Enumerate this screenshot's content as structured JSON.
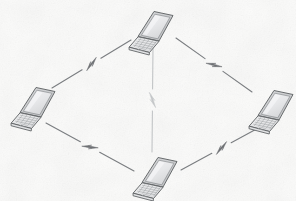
{
  "diagram": {
    "title": "Wireless mesh network of four laptops",
    "type": "network-topology",
    "canvas": {
      "width": 296,
      "height": 201
    },
    "background": {
      "color": "#fbfbfa",
      "texture": "speckled-paper",
      "texture_color": "#e8e8e6"
    },
    "style": {
      "line_color": "#7a7d80",
      "line_color_faint": "#bdc0c2",
      "laptop_outline": "#5a5d60",
      "laptop_screen_fill": "#e3e4e6",
      "laptop_screen_inner": "#f2f2f3",
      "laptop_base_fill": "#eceded",
      "laptop_key_color": "#9b9ea0",
      "link_width": 1.1,
      "link_width_faint": 1.0
    },
    "nodes": [
      {
        "id": "laptop-top",
        "label": "Laptop",
        "icon": "laptop-icon",
        "x": 151,
        "y": 26,
        "scale": 1.0,
        "anchor": {
          "x": 151,
          "y": 45
        }
      },
      {
        "id": "laptop-left",
        "label": "Laptop",
        "icon": "laptop-icon",
        "x": 33,
        "y": 102,
        "scale": 1.0,
        "anchor": {
          "x": 33,
          "y": 121
        }
      },
      {
        "id": "laptop-right",
        "label": "Laptop",
        "icon": "laptop-icon",
        "x": 271,
        "y": 105,
        "scale": 1.0,
        "anchor": {
          "x": 271,
          "y": 124
        }
      },
      {
        "id": "laptop-bottom",
        "label": "Laptop",
        "icon": "laptop-icon",
        "x": 155,
        "y": 172,
        "scale": 1.0,
        "anchor": {
          "x": 155,
          "y": 191
        }
      }
    ],
    "links": [
      {
        "id": "link-left-top",
        "from": "laptop-left",
        "to": "laptop-top",
        "kind": "wireless",
        "symbol": "lightning-bolt",
        "faint": false,
        "x1": 52,
        "y1": 88,
        "x2": 131,
        "y2": 40
      },
      {
        "id": "link-top-right",
        "from": "laptop-top",
        "to": "laptop-right",
        "kind": "wireless",
        "symbol": "lightning-bolt",
        "faint": false,
        "x1": 176,
        "y1": 38,
        "x2": 252,
        "y2": 92
      },
      {
        "id": "link-left-bottom",
        "from": "laptop-left",
        "to": "laptop-bottom",
        "kind": "wireless",
        "symbol": "lightning-bolt",
        "faint": false,
        "x1": 46,
        "y1": 123,
        "x2": 134,
        "y2": 171
      },
      {
        "id": "link-bottom-right",
        "from": "laptop-bottom",
        "to": "laptop-right",
        "kind": "wireless",
        "symbol": "lightning-bolt",
        "faint": false,
        "x1": 181,
        "y1": 170,
        "x2": 262,
        "y2": 126
      },
      {
        "id": "link-top-bottom",
        "from": "laptop-top",
        "to": "laptop-bottom",
        "kind": "wireless",
        "symbol": "lightning-bolt",
        "faint": true,
        "x1": 153,
        "y1": 48,
        "x2": 152,
        "y2": 152
      }
    ]
  }
}
